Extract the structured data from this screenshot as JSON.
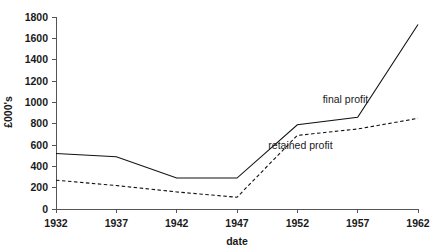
{
  "chart_data": {
    "type": "line",
    "title": "",
    "xlabel": "date",
    "ylabel": "£000's",
    "x": [
      1932,
      1937,
      1942,
      1947,
      1952,
      1957,
      1962
    ],
    "categories": [
      "1932",
      "1937",
      "1942",
      "1947",
      "1952",
      "1957",
      "1962"
    ],
    "xlim": [
      1932,
      1962
    ],
    "ylim": [
      0,
      1800
    ],
    "yticks": [
      0,
      200,
      400,
      600,
      800,
      1000,
      1200,
      1400,
      1600,
      1800
    ],
    "ytick_labels": [
      "0",
      "200",
      "400",
      "600",
      "800",
      "1000",
      "1200",
      "1400",
      "1600",
      "1800"
    ],
    "xticks": [
      1932,
      1937,
      1942,
      1947,
      1952,
      1957,
      1962
    ],
    "xtick_labels": [
      "1932",
      "1937",
      "1942",
      "1947",
      "1952",
      "1957",
      "1962"
    ],
    "grid": false,
    "legend_position": "inline-annotation",
    "series": [
      {
        "name": "final profit",
        "style": "solid",
        "color": "#111111",
        "values": [
          520,
          490,
          290,
          290,
          790,
          860,
          1730
        ]
      },
      {
        "name": "retained profit",
        "style": "dashed",
        "color": "#111111",
        "values": [
          270,
          220,
          160,
          110,
          690,
          750,
          850
        ]
      }
    ],
    "annotations": [
      {
        "text": "final profit",
        "x": 1954.1,
        "y": 990
      },
      {
        "text": "retained profit",
        "x": 1949.6,
        "y": 560
      }
    ]
  }
}
